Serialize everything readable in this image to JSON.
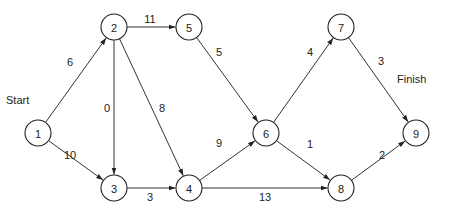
{
  "diagram": {
    "type": "network-activity-diagram",
    "labels": {
      "start": "Start",
      "finish": "Finish"
    },
    "nodes": [
      {
        "id": "1",
        "x": 38,
        "y": 133
      },
      {
        "id": "2",
        "x": 114,
        "y": 27
      },
      {
        "id": "3",
        "x": 114,
        "y": 188
      },
      {
        "id": "4",
        "x": 189,
        "y": 188
      },
      {
        "id": "5",
        "x": 189,
        "y": 27
      },
      {
        "id": "6",
        "x": 266,
        "y": 133
      },
      {
        "id": "7",
        "x": 341,
        "y": 27
      },
      {
        "id": "8",
        "x": 341,
        "y": 188
      },
      {
        "id": "9",
        "x": 416,
        "y": 133
      }
    ],
    "edges": [
      {
        "from": "1",
        "to": "2",
        "weight": "6",
        "lx": 70,
        "ly": 62
      },
      {
        "from": "1",
        "to": "3",
        "weight": "10",
        "lx": 70,
        "ly": 155
      },
      {
        "from": "2",
        "to": "5",
        "weight": "11",
        "lx": 150,
        "ly": 19
      },
      {
        "from": "2",
        "to": "3",
        "weight": "0",
        "lx": 107,
        "ly": 108
      },
      {
        "from": "2",
        "to": "4",
        "weight": "8",
        "lx": 162,
        "ly": 108
      },
      {
        "from": "3",
        "to": "4",
        "weight": "3",
        "lx": 150,
        "ly": 197
      },
      {
        "from": "5",
        "to": "6",
        "weight": "5",
        "lx": 219,
        "ly": 52
      },
      {
        "from": "4",
        "to": "6",
        "weight": "9",
        "lx": 219,
        "ly": 143
      },
      {
        "from": "4",
        "to": "8",
        "weight": "13",
        "lx": 265,
        "ly": 197
      },
      {
        "from": "6",
        "to": "7",
        "weight": "4",
        "lx": 310,
        "ly": 52
      },
      {
        "from": "6",
        "to": "8",
        "weight": "1",
        "lx": 310,
        "ly": 144
      },
      {
        "from": "7",
        "to": "9",
        "weight": "3",
        "lx": 381,
        "ly": 61
      },
      {
        "from": "8",
        "to": "9",
        "weight": "2",
        "lx": 382,
        "ly": 155
      }
    ],
    "node_radius": 13
  }
}
